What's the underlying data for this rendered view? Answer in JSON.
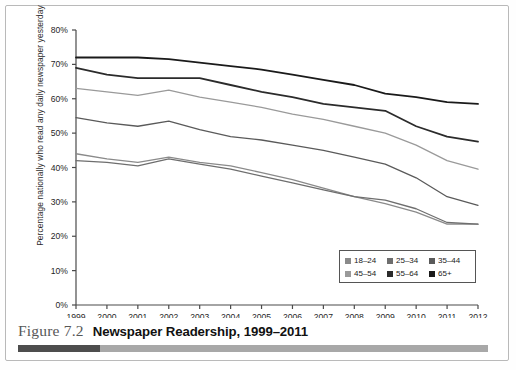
{
  "figure": {
    "label": "Figure 7.2",
    "title": "Newspaper Readership, 1999–2011",
    "bar_dark_color": "#4d4d4d",
    "bar_light_color": "#a8a8a8"
  },
  "chart_data": {
    "type": "line",
    "title": "",
    "xlabel": "",
    "ylabel": "Percentage nationally who read any daily newspaper yesterday",
    "x": [
      1999,
      2000,
      2001,
      2002,
      2003,
      2004,
      2005,
      2006,
      2007,
      2008,
      2009,
      2010,
      2011,
      2012
    ],
    "xtick_labels": [
      "1999",
      "2000",
      "2001",
      "2002",
      "2003",
      "2004",
      "2005",
      "2006",
      "2007",
      "2008",
      "2009",
      "2010",
      "2011",
      "2012"
    ],
    "xlim": [
      1999,
      2012
    ],
    "ytick_labels": [
      "0%",
      "10%",
      "20%",
      "30%",
      "40%",
      "50%",
      "60%",
      "70%",
      "80%"
    ],
    "ytick_values": [
      0,
      10,
      20,
      30,
      40,
      50,
      60,
      70,
      80
    ],
    "ylim": [
      0,
      80
    ],
    "grid": false,
    "legend_position": "bottom-right",
    "series": [
      {
        "name": "18–24",
        "color": "#8a8a8a",
        "values": [
          44.0,
          42.5,
          41.5,
          43.0,
          41.5,
          40.5,
          38.5,
          36.5,
          34.0,
          31.5,
          29.5,
          27.0,
          23.5,
          23.5
        ]
      },
      {
        "name": "25–34",
        "color": "#6e6e6e",
        "values": [
          42.0,
          41.5,
          40.5,
          42.5,
          41.0,
          39.5,
          37.5,
          35.5,
          33.5,
          31.5,
          30.5,
          28.0,
          24.0,
          23.5
        ]
      },
      {
        "name": "35–44",
        "color": "#5a5a5a",
        "values": [
          54.5,
          53.0,
          52.0,
          53.5,
          51.0,
          49.0,
          48.0,
          46.5,
          45.0,
          43.0,
          41.0,
          37.0,
          31.5,
          29.0
        ]
      },
      {
        "name": "45–54",
        "color": "#9a9a9a",
        "values": [
          63.0,
          62.0,
          61.0,
          62.5,
          60.5,
          59.0,
          57.5,
          55.5,
          54.0,
          52.0,
          50.0,
          46.5,
          42.0,
          39.5
        ]
      },
      {
        "name": "55–64",
        "color": "#2b2b2b",
        "values": [
          69.0,
          67.0,
          66.0,
          66.0,
          66.0,
          64.0,
          62.0,
          60.5,
          58.5,
          57.5,
          56.5,
          52.0,
          49.0,
          47.5
        ]
      },
      {
        "name": "65+",
        "color": "#1a1a1a",
        "values": [
          72.0,
          72.0,
          72.0,
          71.5,
          70.5,
          69.5,
          68.5,
          67.0,
          65.5,
          64.0,
          61.5,
          60.5,
          59.0,
          58.5
        ]
      }
    ]
  },
  "legend": {
    "rows": [
      [
        {
          "label": "18–24",
          "color": "#8a8a8a"
        },
        {
          "label": "25–34",
          "color": "#6e6e6e"
        },
        {
          "label": "35–44",
          "color": "#5a5a5a"
        }
      ],
      [
        {
          "label": "45–54",
          "color": "#9a9a9a"
        },
        {
          "label": "55–64",
          "color": "#2b2b2b"
        },
        {
          "label": "65+",
          "color": "#1a1a1a"
        }
      ]
    ]
  }
}
